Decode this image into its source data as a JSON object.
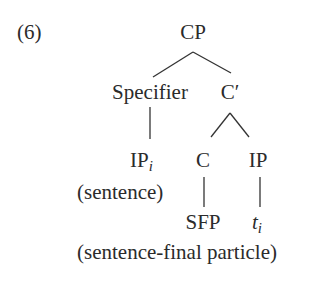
{
  "example_number": "(6)",
  "tree": {
    "root": {
      "label": "CP"
    },
    "specifier": {
      "label": "Specifier"
    },
    "c_bar": {
      "label": "C′"
    },
    "ip_moved": {
      "label": "IP",
      "subscript": "i",
      "gloss": "(sentence)"
    },
    "c_head": {
      "label": "C",
      "child": "SFP"
    },
    "ip_trace_parent": {
      "label": "IP",
      "trace": "t",
      "trace_subscript": "i"
    },
    "bottom_gloss": "(sentence-final particle)"
  },
  "edges": [
    [
      "CP",
      "Specifier"
    ],
    [
      "CP",
      "C′"
    ],
    [
      "Specifier",
      "IP_i"
    ],
    [
      "C′",
      "C"
    ],
    [
      "C′",
      "IP"
    ],
    [
      "C",
      "SFP"
    ],
    [
      "IP",
      "t_i"
    ]
  ]
}
